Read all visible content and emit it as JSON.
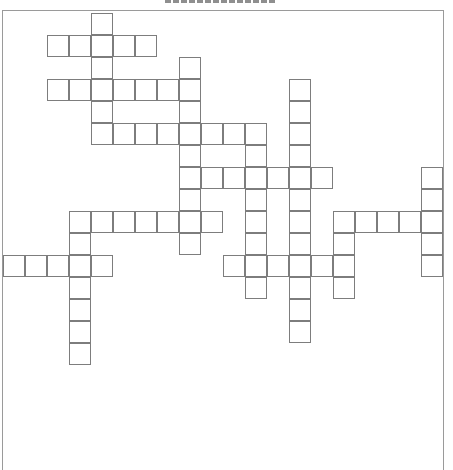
{
  "page": {
    "title": ""
  },
  "puzzle": {
    "type": "crossword",
    "cell_size_px": 22,
    "colors": {
      "cell_border": "#7d7d7d",
      "frame_border": "#9a9a9a",
      "background": "#ffffff"
    },
    "words": [
      {
        "id": "d1",
        "direction": "down",
        "row": 0,
        "col": 4,
        "length": 6
      },
      {
        "id": "a1",
        "direction": "across",
        "row": 1,
        "col": 2,
        "length": 5
      },
      {
        "id": "d2",
        "direction": "down",
        "row": 2,
        "col": 8,
        "length": 9
      },
      {
        "id": "a2",
        "direction": "across",
        "row": 3,
        "col": 2,
        "length": 7
      },
      {
        "id": "d3",
        "direction": "down",
        "row": 3,
        "col": 13,
        "length": 12
      },
      {
        "id": "a3",
        "direction": "across",
        "row": 5,
        "col": 5,
        "length": 7
      },
      {
        "id": "d4",
        "direction": "down",
        "row": 5,
        "col": 11,
        "length": 8
      },
      {
        "id": "a4",
        "direction": "across",
        "row": 7,
        "col": 8,
        "length": 7
      },
      {
        "id": "d5",
        "direction": "down",
        "row": 7,
        "col": 19,
        "length": 5
      },
      {
        "id": "a5",
        "direction": "across",
        "row": 9,
        "col": 3,
        "length": 7
      },
      {
        "id": "d6",
        "direction": "down",
        "row": 9,
        "col": 3,
        "length": 7
      },
      {
        "id": "a6",
        "direction": "across",
        "row": 9,
        "col": 15,
        "length": 5
      },
      {
        "id": "d7",
        "direction": "down",
        "row": 9,
        "col": 15,
        "length": 4
      },
      {
        "id": "a7",
        "direction": "across",
        "row": 11,
        "col": 0,
        "length": 5
      },
      {
        "id": "a8",
        "direction": "across",
        "row": 11,
        "col": 10,
        "length": 6
      }
    ]
  }
}
